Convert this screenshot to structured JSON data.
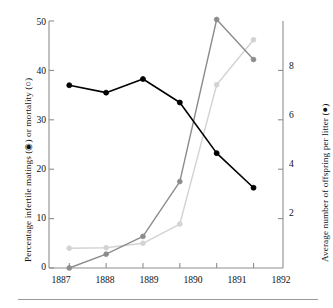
{
  "chart_data": {
    "type": "line",
    "title": "",
    "subtitle": "",
    "x": [
      "1887",
      "1888",
      "1889",
      "1890",
      "1891",
      "1892"
    ],
    "categories": [
      "1887",
      "1888",
      "1889",
      "1890",
      "1891",
      "1892"
    ],
    "xlabel": "",
    "ylabel": "Percentage infertile matings (◉) or mortality (○)",
    "ylabel_right": "Average number of offspring per litter (●)",
    "ylim": [
      0,
      50
    ],
    "ylim_right": [
      0,
      10
    ],
    "yticks": [
      0,
      10,
      20,
      30,
      40,
      50
    ],
    "yticks_right": [
      2,
      4,
      6,
      8
    ],
    "grid": false,
    "legend": "none",
    "legend_entries": [
      {
        "name": "Average number of offspring per litter",
        "marker": "●",
        "color": "#000000",
        "axis": "right"
      },
      {
        "name": "Percentage infertile matings",
        "marker": "◉",
        "color": "#8c8c8c",
        "axis": "left"
      },
      {
        "name": "Percentage mortality",
        "marker": "○",
        "color": "#d3d3d3",
        "axis": "left"
      }
    ],
    "series": [
      {
        "name": "Average number of offspring per litter",
        "marker": "●",
        "color": "#000000",
        "axis": "right",
        "values": [
          7.4,
          7.1,
          7.65,
          6.7,
          4.65,
          3.25
        ],
        "values_left_scale": [
          37.0,
          35.5,
          38.3,
          33.5,
          23.2,
          16.3
        ]
      },
      {
        "name": "Percentage infertile matings",
        "marker": "◉",
        "color": "#8c8c8c",
        "axis": "left",
        "values": [
          0.0,
          2.8,
          6.4,
          17.5,
          50.3,
          42.2
        ]
      },
      {
        "name": "Percentage mortality",
        "marker": "○",
        "color": "#d3d3d3",
        "axis": "left",
        "values": [
          4.0,
          4.1,
          5.0,
          8.9,
          37.1,
          46.2
        ]
      }
    ]
  },
  "axes": {
    "left": {
      "title": "Percentage infertile matings (◉) or mortality (○)",
      "ticks": [
        "0",
        "10",
        "20",
        "30",
        "40",
        "50"
      ]
    },
    "right": {
      "title": "Average number of offspring per litter (●)",
      "ticks": [
        "2",
        "4",
        "6",
        "8"
      ]
    },
    "bottom": {
      "ticks": [
        "1887",
        "1888",
        "1889",
        "1890",
        "1891",
        "1892"
      ]
    }
  },
  "colors": {
    "offspring_series": "#000000",
    "infertile_series": "#8c8c8c",
    "mortality_series": "#d3d3d3",
    "axis": "#8e8e8e",
    "text": "#111111",
    "rule": "#9a9a9a",
    "background": "#ffffff"
  }
}
